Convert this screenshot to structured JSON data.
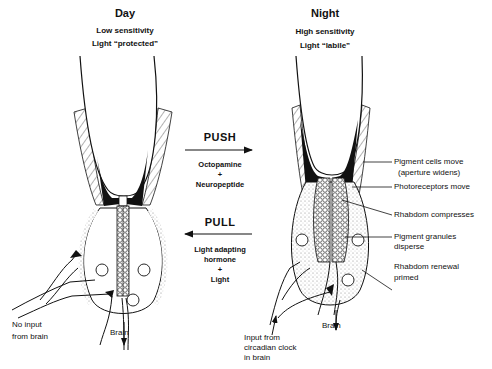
{
  "day": {
    "title": "Day",
    "line1": "Low sensitivity",
    "line2": "Light “protected”",
    "label_no_input_1": "No input",
    "label_no_input_2": "from brain",
    "label_brain": "Brain"
  },
  "night": {
    "title": "Night",
    "line1": "High sensitivity",
    "line2": "Light “labile”",
    "label_brain": "Brain",
    "label_input_1": "Input from",
    "label_input_2": "circadian clock",
    "label_input_3": "in brain",
    "annotations": [
      {
        "line1": "Pigment cells move",
        "line2": "(aperture widens)"
      },
      {
        "line1": "Photoreceptors move",
        "line2": ""
      },
      {
        "line1": "Rhabdom compresses",
        "line2": ""
      },
      {
        "line1": "Pigment granules",
        "line2": "disperse"
      },
      {
        "line1": "Rhabdom renewal",
        "line2": "primed"
      }
    ]
  },
  "push": {
    "title": "PUSH",
    "line1": "Octopamine",
    "plus": "+",
    "line2": "Neuropeptide",
    "direction": "right"
  },
  "pull": {
    "title": "PULL",
    "line1": "Light adapting",
    "line2": "hormone",
    "plus": "+",
    "line3": "Light",
    "direction": "left"
  },
  "colors": {
    "ink": "#111111",
    "background": "#ffffff",
    "stipple": "#9a9a9a"
  }
}
